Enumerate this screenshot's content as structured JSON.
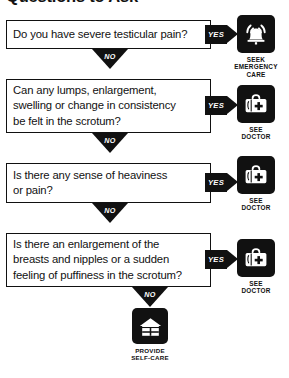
{
  "header": {
    "title": "Questions to Ask"
  },
  "labels": {
    "yes": "YES",
    "no": "NO"
  },
  "colors": {
    "ink": "#111111",
    "paper": "#ffffff"
  },
  "flow": {
    "questions": [
      {
        "id": "q1",
        "lines": [
          "Do you have severe testicular pain?"
        ],
        "yes_label": "YES",
        "no_label": "NO",
        "outcome": {
          "icon": "alarm-bell-icon",
          "caption": [
            "SEEK",
            "EMERGENCY",
            "CARE"
          ]
        }
      },
      {
        "id": "q2",
        "lines": [
          "Can any lumps, enlargement,",
          "swelling or change in consistency",
          "be felt in the scrotum?"
        ],
        "yes_label": "YES",
        "no_label": "NO",
        "outcome": {
          "icon": "medical-bag-icon",
          "caption": [
            "SEE",
            "DOCTOR"
          ]
        }
      },
      {
        "id": "q3",
        "lines": [
          "Is there any sense of heaviness",
          "or pain?"
        ],
        "yes_label": "YES",
        "no_label": "NO",
        "outcome": {
          "icon": "medical-bag-icon",
          "caption": [
            "SEE",
            "DOCTOR"
          ]
        }
      },
      {
        "id": "q4",
        "lines": [
          "Is there an enlargement of the",
          "breasts and nipples or a sudden",
          "feeling of puffiness in the scrotum?"
        ],
        "yes_label": "YES",
        "no_label": "NO",
        "outcome": {
          "icon": "medical-bag-icon",
          "caption": [
            "SEE",
            "DOCTOR"
          ]
        }
      }
    ],
    "final_outcome": {
      "icon": "house-icon",
      "caption": [
        "PROVIDE",
        "SELF-CARE"
      ]
    }
  }
}
